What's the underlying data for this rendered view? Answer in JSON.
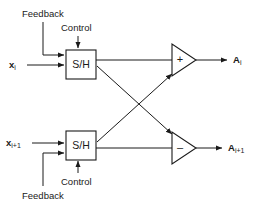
{
  "diagram": {
    "ink_color": "#1a1a1a",
    "background_color": "#ffffff",
    "top_channel": {
      "input_label": "x",
      "input_sub": "i",
      "feedback_label": "Feedback",
      "control_label": "Control",
      "block_label": "S/H",
      "amp_sign": "+",
      "output_label": "A",
      "output_sub": "i"
    },
    "bottom_channel": {
      "input_label": "x",
      "input_sub": "i+1",
      "feedback_label": "Feedback",
      "control_label": "Control",
      "block_label": "S/H",
      "amp_sign": "–",
      "output_label": "A",
      "output_sub": "i+1"
    }
  }
}
